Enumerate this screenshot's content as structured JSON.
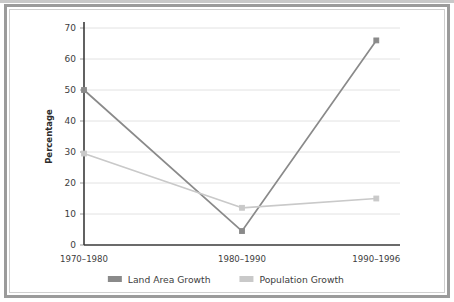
{
  "figure": {
    "background": "#ffffff",
    "frame_color": "#9b9b9b",
    "inner_frame_color": "#cfcfcf"
  },
  "chart_data": {
    "type": "line",
    "title": "",
    "xlabel": "",
    "ylabel": "Percentage",
    "categories": [
      "1970–1980",
      "1980–1990",
      "1990–1996"
    ],
    "ylim": [
      0,
      70
    ],
    "ytick_labels": [
      "0",
      "10",
      "20",
      "30",
      "40",
      "50",
      "60",
      "70"
    ],
    "ytick_values": [
      0,
      10,
      20,
      30,
      40,
      50,
      60,
      70
    ],
    "grid": true,
    "grid_axis": "y",
    "legend_position": "bottom-center",
    "markers": "square",
    "series": [
      {
        "name": "Land Area Growth",
        "color": "#8a8a8a",
        "values": [
          50,
          4.5,
          66
        ]
      },
      {
        "name": "Population Growth",
        "color": "#c9c9c9",
        "values": [
          29.5,
          12,
          15
        ]
      }
    ]
  },
  "legend": {
    "items": [
      {
        "label": "Land Area Growth",
        "color": "#8a8a8a"
      },
      {
        "label": "Population Growth",
        "color": "#c9c9c9"
      }
    ]
  }
}
